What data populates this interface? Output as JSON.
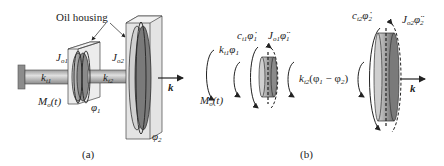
{
  "figure": {
    "panel_a": {
      "caption": "(a)",
      "labels": {
        "oil_housing": "Oil housing",
        "J_o1": "J",
        "J_o1_sub": "o1",
        "J_o2": "J",
        "J_o2_sub": "o2",
        "k_t1": "k",
        "k_t1_sub": "t1",
        "k_t2": "k",
        "k_t2_sub": "t2",
        "M_o": "M",
        "M_o_sub": "o",
        "M_o_arg": "(t)",
        "phi1": "φ",
        "phi1_sub": "1",
        "phi2": "φ",
        "phi2_sub": "2",
        "k_vec": "k"
      }
    },
    "panel_b": {
      "caption": "(b)",
      "labels": {
        "k_t1_phi1": "k",
        "k_t1_phi1_sub": "t1",
        "k_t1_phi1_var": "φ",
        "k_t1_phi1_var_sub": "1",
        "c_t1_phidot1": "c",
        "c_t1_sub": "t1",
        "c_t1_var": "φ̇",
        "c_t1_var_sub": "1",
        "J_o1_phiddot1": "J",
        "J_o1_sub": "o1",
        "J_o1_var": "φ̈",
        "J_o1_var_sub": "1",
        "M_o": "M",
        "M_o_sub": "o",
        "M_o_arg": "(t)",
        "k_t2_diff": "k",
        "k_t2_diff_sub": "t2",
        "k_t2_diff_expr": "(φ",
        "k_t2_diff_expr_sub1": "1",
        "k_t2_diff_minus": " − φ",
        "k_t2_diff_expr_sub2": "2",
        "k_t2_diff_close": ")",
        "c_t2_phidot2": "c",
        "c_t2_sub": "t2",
        "c_t2_var": "φ̇",
        "c_t2_var_sub": "2",
        "J_o2_phiddot2": "J",
        "J_o2_sub": "o2",
        "J_o2_var": "φ̈",
        "J_o2_var_sub": "2",
        "k_vec": "k"
      }
    },
    "colors": {
      "line": "#222222",
      "shaft_light": "#d8d8d8",
      "shaft_dark": "#8a8a8a",
      "housing_fill": "#e6e6e6",
      "disk_dark": "#6f6f6f",
      "disk_light": "#c4c4c4"
    }
  }
}
